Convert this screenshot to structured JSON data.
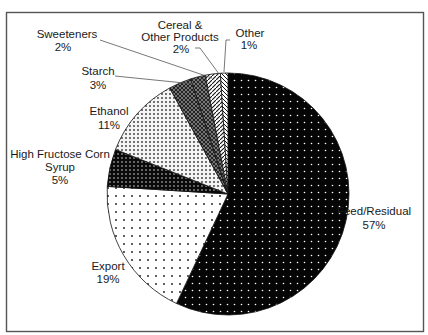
{
  "chart_data": {
    "type": "pie",
    "title": "",
    "categories": [
      "Feed/Residual",
      "Export",
      "High Fructose Corn Syrup",
      "Ethanol",
      "Starch",
      "Sweeteners",
      "Cereal & Other Products",
      "Other"
    ],
    "values": [
      57,
      19,
      5,
      11,
      3,
      2,
      2,
      1
    ],
    "unit": "%",
    "start_angle_deg": 0,
    "direction": "clockwise",
    "legend": "none (direct labels)",
    "slices": [
      {
        "label": "Feed/Residual",
        "value": 57,
        "pct_text": "57%",
        "pattern": "black-with-white-dots"
      },
      {
        "label": "Export",
        "value": 19,
        "pct_text": "19%",
        "pattern": "white-with-sparse-dots"
      },
      {
        "label": "High Fructose Corn Syrup",
        "label_lines": [
          "High Fructose Corn",
          "Syrup"
        ],
        "value": 5,
        "pct_text": "5%",
        "pattern": "black-with-dense-white-dots"
      },
      {
        "label": "Ethanol",
        "value": 11,
        "pct_text": "11%",
        "pattern": "white-with-dense-dots"
      },
      {
        "label": "Starch",
        "value": 3,
        "pct_text": "3%",
        "pattern": "dark-crosshatch"
      },
      {
        "label": "Sweeteners",
        "value": 2,
        "pct_text": "2%",
        "pattern": "grey-crosshatch"
      },
      {
        "label": "Cereal & Other Products",
        "label_lines": [
          "Cereal &",
          "Other Products"
        ],
        "value": 2,
        "pct_text": "2%",
        "pattern": "diagonal-hatch"
      },
      {
        "label": "Other",
        "value": 1,
        "pct_text": "1%",
        "pattern": "diagonal-hatch-light"
      }
    ]
  }
}
